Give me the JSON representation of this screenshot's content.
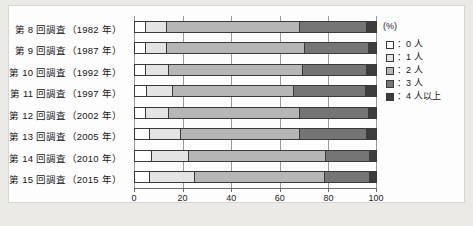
{
  "chart_data": {
    "type": "bar",
    "orientation": "horizontal",
    "stacked": true,
    "stacked_normalized": true,
    "title": "",
    "xlabel": "(%)",
    "ylabel": "",
    "xlim": [
      0,
      100
    ],
    "xticks": [
      0,
      20,
      40,
      60,
      80,
      100
    ],
    "xticklabels": [
      "0",
      "20",
      "40",
      "60",
      "80",
      "100"
    ],
    "unit_label": "(%)",
    "grid": true,
    "legend_position": "right",
    "categories": [
      "第 8 回調査（1982 年）",
      "第 9 回調査（1987 年）",
      "第 10 回調査（1992 年）",
      "第 11 回調査（1997 年）",
      "第 12 回調査（2002 年）",
      "第 13 回調査（2005 年）",
      "第 14 回調査（2010 年）",
      "第 15 回調査（2015 年）"
    ],
    "series": [
      {
        "name": "0 人",
        "color": "#ffffff",
        "values": [
          4.0,
          4.0,
          4.0,
          4.5,
          4.0,
          6.0,
          6.5,
          6.0
        ]
      },
      {
        "name": "1 人",
        "color": "#e4e4e4",
        "values": [
          9.0,
          9.0,
          9.5,
          11.0,
          9.5,
          12.5,
          15.5,
          18.5
        ]
      },
      {
        "name": "2 人",
        "color": "#b6b6b6",
        "values": [
          55.0,
          57.0,
          56.0,
          50.0,
          54.5,
          49.5,
          57.0,
          54.0
        ]
      },
      {
        "name": "3 人",
        "color": "#757575",
        "values": [
          28.0,
          26.5,
          26.5,
          30.0,
          28.5,
          28.0,
          18.0,
          18.5
        ]
      },
      {
        "name": "4 人以上",
        "color": "#3d3d3d",
        "values": [
          4.0,
          3.5,
          4.0,
          4.5,
          3.5,
          4.0,
          3.0,
          3.0
        ]
      }
    ],
    "legend": [
      {
        "label": "：0 人",
        "color": "#ffffff"
      },
      {
        "label": "：1 人",
        "color": "#e4e4e4"
      },
      {
        "label": "：2 人",
        "color": "#b6b6b6"
      },
      {
        "label": "：3 人",
        "color": "#757575"
      },
      {
        "label": "：4 人以上",
        "color": "#3d3d3d"
      }
    ]
  },
  "figure": {
    "background": "#eceae6",
    "plate_background": "#fdfdfd",
    "axis_color": "#6a6a6a",
    "grid_color": "#9a9a9a",
    "bar_border": "#3a3a3a"
  }
}
